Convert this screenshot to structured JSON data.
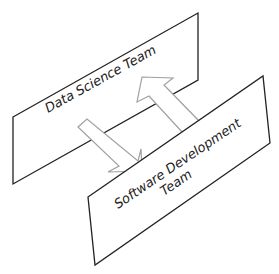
{
  "diagram": {
    "panels": [
      {
        "id": "data-science",
        "label_lines": [
          "Data Science Team"
        ]
      },
      {
        "id": "software-development",
        "label_lines": [
          "Software Development",
          "Team"
        ]
      }
    ],
    "arrows": [
      {
        "id": "up",
        "from": "software-development",
        "to": "data-science"
      },
      {
        "id": "down",
        "from": "data-science",
        "to": "software-development"
      }
    ],
    "colors": {
      "panel_stroke": "#222222",
      "arrow_stroke": "#a0a0a0",
      "background": "#ffffff"
    }
  }
}
